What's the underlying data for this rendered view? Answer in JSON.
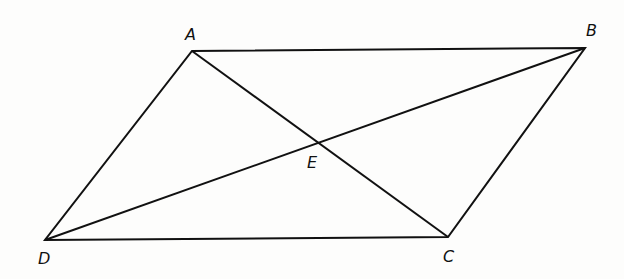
{
  "diagram": {
    "type": "parallelogram with diagonals",
    "points": {
      "A": {
        "label": "A",
        "x": 192,
        "y": 51
      },
      "B": {
        "label": "B",
        "x": 585,
        "y": 48
      },
      "C": {
        "label": "C",
        "x": 448,
        "y": 237
      },
      "D": {
        "label": "D",
        "x": 45,
        "y": 240
      },
      "E": {
        "label": "E",
        "x": 320,
        "y": 143
      }
    },
    "segments": [
      "AB",
      "BC",
      "CD",
      "DA",
      "AC",
      "BD"
    ],
    "line_color": "#111111"
  }
}
